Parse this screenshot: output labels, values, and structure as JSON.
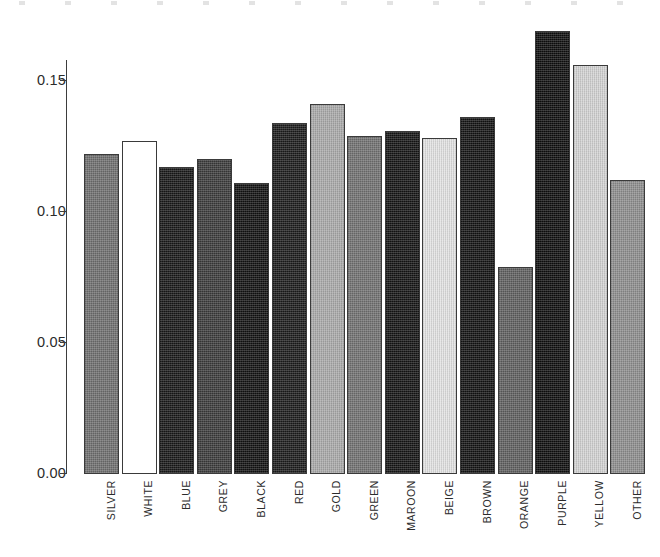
{
  "chart_data": {
    "type": "bar",
    "title": "",
    "subtitle": "",
    "xlabel": "",
    "ylabel": "",
    "categories": [
      "SILVER",
      "WHITE",
      "BLUE",
      "GREY",
      "BLACK",
      "RED",
      "GOLD",
      "GREEN",
      "MAROON",
      "BEIGE",
      "BROWN",
      "ORANGE",
      "PURPLE",
      "YELLOW",
      "OTHER"
    ],
    "values": [
      0.122,
      0.127,
      0.117,
      0.12,
      0.111,
      0.134,
      0.141,
      0.129,
      0.131,
      0.128,
      0.136,
      0.079,
      0.169,
      0.156,
      0.112
    ],
    "bar_fills": [
      "#6e6e6e",
      "#ffffff",
      "#171717",
      "#3a3a3a",
      "#111111",
      "#1b1b1b",
      "#a9a9a9",
      "#707070",
      "#141414",
      "#e2e2e2",
      "#121212",
      "#5e5e5e",
      "#0d0d0d",
      "#d2d2d2",
      "#8d8d8d"
    ],
    "bar_edge_color": "#3a3a3a",
    "ylim": [
      0.0,
      0.1575
    ],
    "yticks": [
      0.0,
      0.05,
      0.1,
      0.15
    ],
    "ytick_labels": [
      "0.00",
      "0.05",
      "0.10",
      "0.15"
    ],
    "grid": false,
    "legend": null,
    "legend_position": "none",
    "axis_color": "#3d3d3d",
    "background": "#ffffff"
  },
  "axis": {
    "y_tick_labels": [
      "0.15",
      "0.10",
      "0.05",
      "0.00"
    ]
  }
}
